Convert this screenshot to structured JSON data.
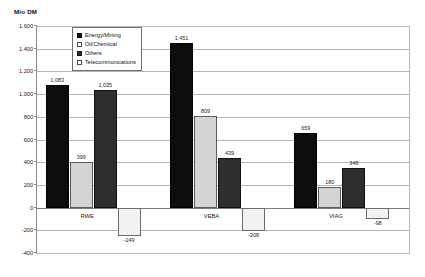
{
  "chart_data": {
    "type": "bar",
    "title": "",
    "ylabel": "Mio DM",
    "xlabel": "",
    "ylim": [
      -400,
      1600
    ],
    "ytick_step": 200,
    "grid": true,
    "legend_position": "top-center-inside",
    "ytick_labels": [
      "1.600",
      "1.400",
      "1.200",
      "1.000",
      "800",
      "600",
      "400",
      "200",
      "0",
      "-200",
      "-400"
    ],
    "ytick_values": [
      1600,
      1400,
      1200,
      1000,
      800,
      600,
      400,
      200,
      0,
      -200,
      -400
    ],
    "categories": [
      "RWE",
      "VEBA",
      "VIAG"
    ],
    "series": [
      {
        "name": "Energy/Mining",
        "values": [
          1083,
          1451,
          659
        ],
        "labels": [
          "1,083",
          "1,451",
          "659"
        ]
      },
      {
        "name": "Oil/Chemical",
        "values": [
          399,
          809,
          180
        ],
        "labels": [
          "399",
          "809",
          "180"
        ]
      },
      {
        "name": "Others",
        "values": [
          1035,
          439,
          348
        ],
        "labels": [
          "1,035",
          "439",
          "348"
        ]
      },
      {
        "name": "Telecommunications",
        "values": [
          -249,
          -208,
          -98
        ],
        "labels": [
          "-249",
          "-208",
          "-98"
        ]
      }
    ],
    "series_colors": [
      "#0d0d0d",
      "#d4d4d4",
      "#2e2e2e",
      "#f2f2f2"
    ]
  },
  "axis_unit_caption": "Mio DM",
  "legend": {
    "items": [
      {
        "label": "Energy/Mining"
      },
      {
        "label": "Oil/Chemical"
      },
      {
        "label": "Others"
      },
      {
        "label": "Telecommunications"
      }
    ]
  }
}
